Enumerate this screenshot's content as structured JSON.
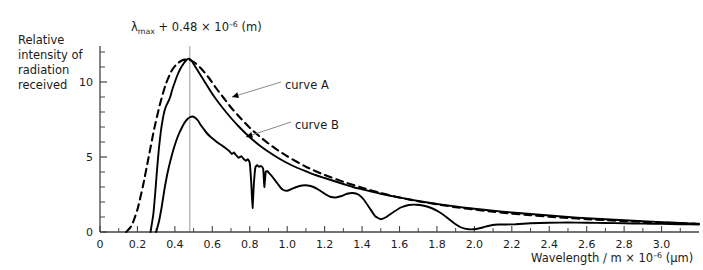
{
  "chart_data": {
    "type": "line",
    "title": "",
    "annotation_top": {
      "lambda": "λ",
      "sub": "max",
      "rest": " + 0.48 × 10",
      "exp": "–6",
      "tail": " (m)",
      "full_text": "λmax + 0.48 × 10−6 (m)"
    },
    "ylabel_lines": [
      "Relative",
      "intensity of",
      "radiation",
      "received"
    ],
    "xlabel": {
      "main": "Wavelength / m × 10",
      "exp": "–6",
      "unit": " (μm)",
      "full_text": "Wavelength / m × 10−6 (μm)"
    },
    "xlim": [
      0,
      3.2
    ],
    "ylim": [
      0,
      12.4
    ],
    "xticks_major": [
      0,
      0.2,
      0.4,
      0.6,
      0.8,
      1.0,
      1.2,
      1.4,
      1.6,
      1.8,
      2.0,
      2.2,
      2.4,
      2.6,
      2.8,
      3.0
    ],
    "xticklabels": [
      "0",
      "0.2",
      "0.4",
      "0.6",
      "0.8",
      "1.0",
      "1.2",
      "1.4",
      "1.6",
      "1.8",
      "2.0",
      "2.2",
      "2.4",
      "2.6",
      "2.8",
      "3.0"
    ],
    "xticks_minor": [
      0.1,
      0.3,
      0.5,
      0.7,
      0.9,
      1.1,
      1.3,
      1.5,
      1.7,
      1.9,
      2.1,
      2.3,
      2.5,
      2.7,
      2.9,
      3.1
    ],
    "yticks_major": [
      0,
      5,
      10
    ],
    "yticklabels": [
      "0",
      "5",
      "10"
    ],
    "yticks_minor": [
      1,
      2,
      3,
      4,
      6,
      7,
      8,
      9,
      11,
      12
    ],
    "grid": false,
    "legend_position": "inline-callouts",
    "peak_marker": {
      "x": 0.48,
      "label": "lambda-max reference line",
      "color": "#9a9a9a"
    },
    "series": [
      {
        "name": "blackbody-dashed",
        "style": "dashed",
        "color": "#000000",
        "points": [
          [
            0.14,
            0.0
          ],
          [
            0.17,
            0.45
          ],
          [
            0.2,
            1.5
          ],
          [
            0.23,
            3.1
          ],
          [
            0.26,
            5.0
          ],
          [
            0.29,
            6.9
          ],
          [
            0.32,
            8.5
          ],
          [
            0.35,
            9.8
          ],
          [
            0.38,
            10.7
          ],
          [
            0.41,
            11.2
          ],
          [
            0.44,
            11.45
          ],
          [
            0.47,
            11.5
          ],
          [
            0.5,
            11.35
          ],
          [
            0.54,
            10.9
          ],
          [
            0.58,
            10.3
          ],
          [
            0.62,
            9.6
          ],
          [
            0.66,
            8.95
          ],
          [
            0.7,
            8.3
          ],
          [
            0.75,
            7.6
          ],
          [
            0.8,
            6.95
          ],
          [
            0.85,
            6.4
          ],
          [
            0.9,
            5.9
          ],
          [
            0.95,
            5.45
          ],
          [
            1.0,
            5.05
          ],
          [
            1.1,
            4.35
          ],
          [
            1.2,
            3.8
          ],
          [
            1.3,
            3.35
          ],
          [
            1.4,
            2.95
          ],
          [
            1.5,
            2.6
          ],
          [
            1.6,
            2.3
          ],
          [
            1.7,
            2.05
          ],
          [
            1.8,
            1.85
          ],
          [
            1.9,
            1.65
          ],
          [
            2.0,
            1.5
          ],
          [
            2.1,
            1.35
          ],
          [
            2.2,
            1.22
          ],
          [
            2.3,
            1.12
          ],
          [
            2.4,
            1.02
          ],
          [
            2.5,
            0.94
          ],
          [
            2.6,
            0.86
          ],
          [
            2.7,
            0.79
          ],
          [
            2.8,
            0.73
          ],
          [
            2.9,
            0.67
          ],
          [
            3.0,
            0.62
          ],
          [
            3.1,
            0.58
          ],
          [
            3.18,
            0.55
          ]
        ]
      },
      {
        "name": "curve A",
        "label": "curve A",
        "style": "solid",
        "color": "#000000",
        "points": [
          [
            0.27,
            0.0
          ],
          [
            0.285,
            1.2
          ],
          [
            0.295,
            2.6
          ],
          [
            0.305,
            4.2
          ],
          [
            0.315,
            5.6
          ],
          [
            0.325,
            6.7
          ],
          [
            0.335,
            7.5
          ],
          [
            0.345,
            8.1
          ],
          [
            0.355,
            8.45
          ],
          [
            0.365,
            8.7
          ],
          [
            0.375,
            9.0
          ],
          [
            0.385,
            9.45
          ],
          [
            0.4,
            10.0
          ],
          [
            0.415,
            10.5
          ],
          [
            0.43,
            10.9
          ],
          [
            0.445,
            11.2
          ],
          [
            0.46,
            11.45
          ],
          [
            0.475,
            11.55
          ],
          [
            0.49,
            11.4
          ],
          [
            0.51,
            11.0
          ],
          [
            0.53,
            10.6
          ],
          [
            0.56,
            10.0
          ],
          [
            0.59,
            9.4
          ],
          [
            0.62,
            8.85
          ],
          [
            0.66,
            8.2
          ],
          [
            0.7,
            7.6
          ],
          [
            0.74,
            7.05
          ],
          [
            0.78,
            6.55
          ],
          [
            0.82,
            6.1
          ],
          [
            0.86,
            5.7
          ],
          [
            0.9,
            5.35
          ],
          [
            0.95,
            4.95
          ],
          [
            1.0,
            4.6
          ],
          [
            1.05,
            4.3
          ],
          [
            1.1,
            4.05
          ],
          [
            1.15,
            3.8
          ],
          [
            1.2,
            3.6
          ],
          [
            1.25,
            3.4
          ],
          [
            1.3,
            3.2
          ],
          [
            1.35,
            3.0
          ],
          [
            1.4,
            2.85
          ],
          [
            1.45,
            2.7
          ],
          [
            1.5,
            2.55
          ],
          [
            1.55,
            2.42
          ],
          [
            1.6,
            2.3
          ],
          [
            1.65,
            2.18
          ],
          [
            1.7,
            2.07
          ],
          [
            1.75,
            1.97
          ],
          [
            1.8,
            1.87
          ],
          [
            1.85,
            1.78
          ],
          [
            1.9,
            1.7
          ],
          [
            1.95,
            1.62
          ],
          [
            2.0,
            1.55
          ],
          [
            2.1,
            1.42
          ],
          [
            2.2,
            1.3
          ],
          [
            2.3,
            1.2
          ],
          [
            2.4,
            1.1
          ],
          [
            2.5,
            1.0
          ],
          [
            2.6,
            0.92
          ],
          [
            2.7,
            0.85
          ],
          [
            2.8,
            0.78
          ],
          [
            2.9,
            0.72
          ],
          [
            3.0,
            0.66
          ],
          [
            3.1,
            0.6
          ],
          [
            3.2,
            0.55
          ]
        ]
      },
      {
        "name": "curve B",
        "label": "curve B",
        "style": "solid",
        "color": "#000000",
        "points": [
          [
            0.3,
            0.0
          ],
          [
            0.315,
            0.7
          ],
          [
            0.33,
            1.7
          ],
          [
            0.345,
            2.9
          ],
          [
            0.36,
            3.9
          ],
          [
            0.375,
            4.7
          ],
          [
            0.39,
            5.4
          ],
          [
            0.405,
            6.0
          ],
          [
            0.42,
            6.5
          ],
          [
            0.435,
            6.9
          ],
          [
            0.45,
            7.25
          ],
          [
            0.465,
            7.5
          ],
          [
            0.48,
            7.65
          ],
          [
            0.495,
            7.7
          ],
          [
            0.51,
            7.6
          ],
          [
            0.525,
            7.4
          ],
          [
            0.54,
            7.1
          ],
          [
            0.555,
            6.85
          ],
          [
            0.57,
            6.6
          ],
          [
            0.59,
            6.35
          ],
          [
            0.61,
            6.15
          ],
          [
            0.63,
            5.95
          ],
          [
            0.65,
            5.78
          ],
          [
            0.67,
            5.6
          ],
          [
            0.69,
            5.4
          ],
          [
            0.705,
            5.2
          ],
          [
            0.715,
            5.3
          ],
          [
            0.725,
            5.15
          ],
          [
            0.74,
            4.95
          ],
          [
            0.755,
            5.05
          ],
          [
            0.765,
            4.9
          ],
          [
            0.78,
            4.75
          ],
          [
            0.79,
            4.85
          ],
          [
            0.8,
            4.6
          ],
          [
            0.808,
            3.3
          ],
          [
            0.815,
            1.6
          ],
          [
            0.822,
            3.2
          ],
          [
            0.83,
            4.3
          ],
          [
            0.84,
            4.45
          ],
          [
            0.85,
            4.35
          ],
          [
            0.86,
            4.4
          ],
          [
            0.872,
            4.2
          ],
          [
            0.878,
            3.0
          ],
          [
            0.885,
            4.0
          ],
          [
            0.895,
            4.05
          ],
          [
            0.905,
            3.9
          ],
          [
            0.92,
            3.7
          ],
          [
            0.935,
            3.45
          ],
          [
            0.95,
            3.2
          ],
          [
            0.965,
            2.95
          ],
          [
            0.98,
            2.8
          ],
          [
            1.0,
            2.75
          ],
          [
            1.02,
            2.85
          ],
          [
            1.05,
            3.0
          ],
          [
            1.08,
            3.1
          ],
          [
            1.11,
            3.1
          ],
          [
            1.14,
            3.0
          ],
          [
            1.17,
            2.8
          ],
          [
            1.2,
            2.55
          ],
          [
            1.23,
            2.35
          ],
          [
            1.26,
            2.3
          ],
          [
            1.29,
            2.4
          ],
          [
            1.32,
            2.55
          ],
          [
            1.35,
            2.6
          ],
          [
            1.38,
            2.5
          ],
          [
            1.41,
            2.15
          ],
          [
            1.44,
            1.6
          ],
          [
            1.47,
            1.05
          ],
          [
            1.5,
            0.85
          ],
          [
            1.53,
            1.0
          ],
          [
            1.57,
            1.35
          ],
          [
            1.61,
            1.65
          ],
          [
            1.65,
            1.8
          ],
          [
            1.69,
            1.82
          ],
          [
            1.73,
            1.75
          ],
          [
            1.77,
            1.6
          ],
          [
            1.81,
            1.35
          ],
          [
            1.85,
            1.0
          ],
          [
            1.89,
            0.6
          ],
          [
            1.93,
            0.3
          ],
          [
            1.97,
            0.18
          ],
          [
            2.01,
            0.2
          ],
          [
            2.05,
            0.32
          ],
          [
            2.09,
            0.45
          ],
          [
            2.13,
            0.5
          ],
          [
            2.17,
            0.5
          ],
          [
            2.22,
            0.52
          ],
          [
            2.3,
            0.58
          ],
          [
            2.4,
            0.62
          ],
          [
            2.5,
            0.63
          ],
          [
            2.6,
            0.62
          ],
          [
            2.7,
            0.6
          ],
          [
            2.8,
            0.58
          ],
          [
            2.9,
            0.56
          ],
          [
            3.0,
            0.54
          ],
          [
            3.1,
            0.52
          ],
          [
            3.2,
            0.5
          ]
        ]
      }
    ],
    "callouts": [
      {
        "name": "curve-a-callout",
        "label": "curve A",
        "text_x": 285,
        "text_y": 85,
        "line_from": [
          281,
          82
        ],
        "line_to": [
          232,
          97
        ]
      },
      {
        "name": "curve-b-callout",
        "label": "curve B",
        "text_x": 295,
        "text_y": 125,
        "line_from": [
          291,
          122
        ],
        "line_to": [
          246,
          137
        ]
      }
    ]
  }
}
